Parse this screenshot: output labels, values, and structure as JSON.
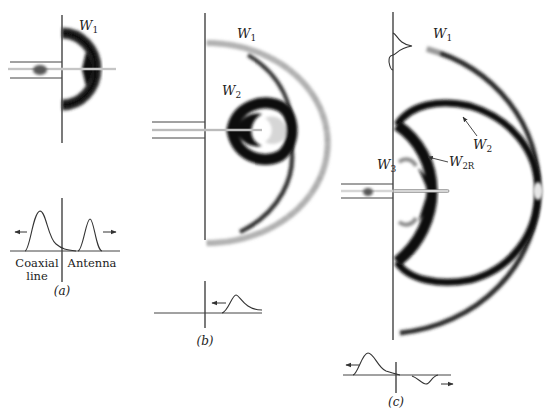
{
  "figure": {
    "panels": [
      {
        "id": "a",
        "caption": "(a)",
        "wave_labels": [
          "W",
          "1"
        ],
        "plot_labels": {
          "left_line1": "Coaxial",
          "left_line2": "line",
          "right": "Antenna"
        },
        "arrows": [
          "left",
          "right"
        ]
      },
      {
        "id": "b",
        "caption": "(b)",
        "wave_labels": {
          "w1": [
            "W",
            "1"
          ],
          "w2": [
            "W",
            "2"
          ]
        },
        "arrows": [
          "left"
        ]
      },
      {
        "id": "c",
        "caption": "(c)",
        "wave_labels": {
          "w1": [
            "W",
            "1"
          ],
          "w2": [
            "W",
            "2"
          ],
          "w2r": [
            "W",
            "2R"
          ],
          "w3": [
            "W",
            "3"
          ]
        },
        "arrows": [
          "left",
          "right"
        ]
      }
    ]
  }
}
